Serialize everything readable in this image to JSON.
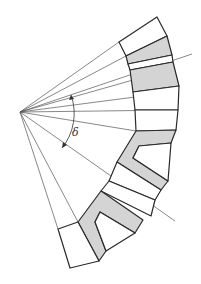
{
  "diagram": {
    "title": "",
    "angle_label": "δ",
    "colors": {
      "background": "#ffffff",
      "stroke": "#2a2a2a",
      "ray": "#555555",
      "fill_shaded": "#d4d4d4",
      "fill_white": "#ffffff"
    },
    "apex": [
      20,
      112
    ],
    "rays_to": [
      [
        119,
        42
      ],
      [
        126,
        56
      ],
      [
        188,
        52
      ],
      [
        129,
        67
      ],
      [
        133,
        80
      ],
      [
        135,
        90
      ],
      [
        178,
        110
      ],
      [
        136,
        130
      ],
      [
        165,
        237
      ],
      [
        80,
        222
      ],
      [
        100,
        199
      ]
    ],
    "angle_arc": {
      "from_deg": -17,
      "to_deg": 28,
      "radius": 55
    }
  }
}
